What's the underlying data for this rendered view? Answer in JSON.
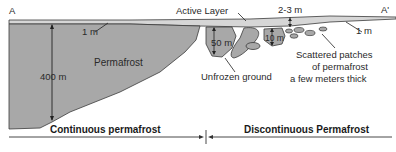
{
  "diagram": {
    "title_left": "A",
    "title_right": "A'",
    "labels": {
      "active_layer": "Active Layer",
      "active_depth_right": "2-3 m",
      "active_depth_left": "1 m",
      "active_depth_far_right": "1 m",
      "permafrost": "Permafrost",
      "depth_400": "400 m",
      "depth_50": "50 m",
      "depth_10": "10 m",
      "unfrozen": "Unfrozen ground",
      "scattered_line1": "Scattered patches",
      "scattered_line2": "of permafrost",
      "scattered_line3": "a few meters thick"
    },
    "zones": {
      "continuous": "Continuous permafrost",
      "discontinuous": "Discontinuous Permafrost"
    },
    "colors": {
      "permafrost_fill": "#a8a8a8",
      "active_layer_fill": "#d6d6d6",
      "outline": "#3a3a3a"
    }
  }
}
